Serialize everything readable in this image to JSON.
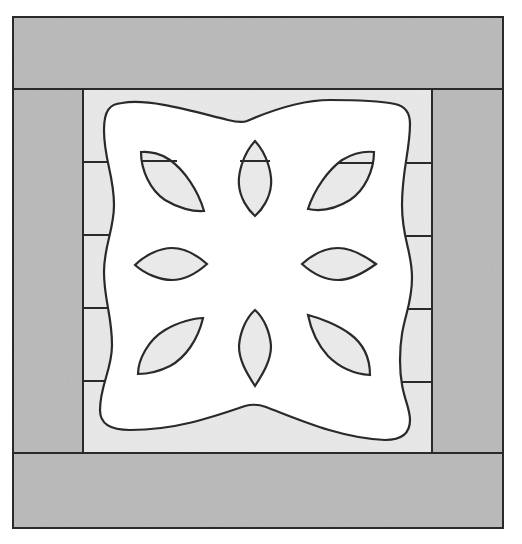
{
  "colors": {
    "background": "#ffffff",
    "border_fabric": "#b9b9b9",
    "panel_fabric": "#e9e9e9",
    "applique": "#ffffff",
    "cutout": "#e9e9e9",
    "stroke": "#2a2a2a"
  },
  "frame": {
    "outer": {
      "x": 13,
      "y": 17,
      "w": 490,
      "h": 511
    },
    "top_border": {
      "x": 13,
      "y": 17,
      "w": 490,
      "h": 72
    },
    "bottom_border": {
      "x": 13,
      "y": 453,
      "w": 490,
      "h": 75
    },
    "left_border": {
      "x": 13,
      "y": 89,
      "w": 70,
      "h": 364
    },
    "right_border": {
      "x": 432,
      "y": 89,
      "w": 71,
      "h": 364
    },
    "inner_panel": {
      "x": 83,
      "y": 89,
      "w": 349,
      "h": 364
    }
  },
  "strip_lines": {
    "left": [
      162,
      235,
      308,
      381
    ],
    "right": [
      163,
      236,
      309,
      382
    ]
  },
  "applique": {
    "outline": "M 122 103 C 150 98 195 112 228 120 C 236 122 242 123 247 121 C 270 111 300 100 330 100 C 365 100 385 102 395 104 C 405 106 410 112 410 124 C 410 150 402 170 402 205 C 402 240 412 250 412 278 C 412 310 400 320 400 360 C 400 395 410 405 410 420 C 410 435 400 440 385 440 C 340 438 300 420 266 407 C 258 404 252 404 245 406 C 210 418 175 430 130 430 C 110 430 100 424 100 410 C 100 385 112 370 112 345 C 112 315 104 300 104 272 C 104 245 114 230 114 205 C 114 175 104 160 104 130 C 104 110 110 104 122 103 Z"
  },
  "petals": [
    {
      "name": "petal-top",
      "d": "M 255 141 C 242 155 238 175 239 185 C 240 198 248 210 255 216 C 262 210 270 198 271 185 C 272 175 268 155 255 141 Z",
      "seam": [
        240,
        161,
        270,
        161
      ]
    },
    {
      "name": "petal-top-left",
      "d": "M 141 152 C 141 170 150 190 165 200 C 178 208 193 212 204 211 C 198 190 184 170 170 160 C 162 154 150 151 141 152 Z",
      "seam": [
        141,
        161,
        177,
        161
      ]
    },
    {
      "name": "petal-top-right",
      "d": "M 374 152 C 374 170 365 190 350 200 C 337 208 322 212 308 209 C 314 190 328 170 342 160 C 352 154 364 151 374 152 Z",
      "seam": [
        338,
        163,
        374,
        163
      ]
    },
    {
      "name": "petal-left",
      "d": "M 135 265 C 145 255 160 248 172 248 C 185 248 198 256 207 264 C 198 272 185 280 172 280 C 160 280 145 274 135 265 Z",
      "seam": null
    },
    {
      "name": "petal-right",
      "d": "M 302 264 C 312 255 325 248 338 248 C 350 248 365 256 376 264 C 365 272 350 280 338 280 C 325 280 312 273 302 264 Z",
      "seam": null
    },
    {
      "name": "petal-bottom-left",
      "d": "M 138 374 C 138 360 148 340 165 330 C 178 322 195 318 203 318 C 198 340 185 358 170 366 C 160 371 148 374 138 374 Z",
      "seam": null
    },
    {
      "name": "petal-bottom",
      "d": "M 255 310 C 246 318 240 332 239 346 C 239 360 246 372 255 386 C 264 372 271 360 271 346 C 270 332 264 318 255 310 Z",
      "seam": null
    },
    {
      "name": "petal-bottom-right",
      "d": "M 308 315 C 320 318 338 325 350 334 C 365 345 370 360 370 375 C 355 374 340 368 328 356 C 318 345 311 330 308 315 Z",
      "seam": null
    }
  ]
}
